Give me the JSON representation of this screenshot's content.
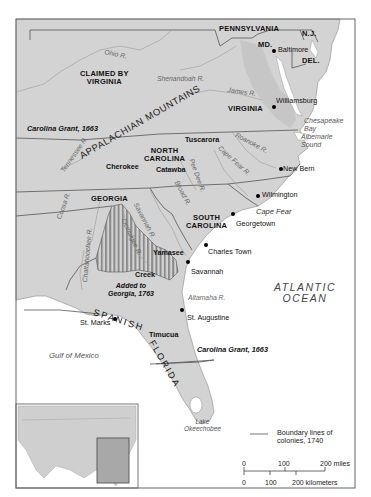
{
  "map": {
    "colors": {
      "land": "#d3d3d3",
      "land_dark": "#bdbdbd",
      "water": "#ffffff",
      "border": "#555555",
      "stripes": "#8a8a8a",
      "frame": "#666666"
    },
    "states": {
      "pennsylvania": "PENNSYLVANIA",
      "md": "MD.",
      "nj": "N.J.",
      "del": "DEL.",
      "claimed_by_virginia": "CLAIMED BY\nVIRGINIA",
      "virginia": "VIRGINIA",
      "north_carolina": "NORTH\nCAROLINA",
      "south_carolina": "SOUTH\nCAROLINA",
      "georgia": "GEORGIA",
      "spanish": "SPANISH",
      "florida": "FLORIDA"
    },
    "mountains": "APPALACHIAN MOUNTAINS",
    "tribes": [
      "Tuscarora",
      "Cherokee",
      "Catawba",
      "Yamasee",
      "Creek",
      "Timucua"
    ],
    "cities": {
      "baltimore": "Baltimore",
      "williamsburg": "Williamsburg",
      "new_bern": "New Bern",
      "wilmington": "Wilmington",
      "georgetown": "Georgetown",
      "charles_town": "Charles Town",
      "savannah": "Savannah",
      "st_augustine": "St. Augustine",
      "st_marks": "St. Marks"
    },
    "rivers": {
      "ohio": "Ohio R.",
      "shenandoah": "Shenandoah R.",
      "james": "James R.",
      "roanoke": "Roanoke R.",
      "cape_fear_r": "Cape Fear R.",
      "pee_dee": "Pee Dee R.",
      "broad": "Broad R.",
      "savannah_r": "Savannah R.",
      "tennessee": "Tennessee R.",
      "coosa": "Coosa R.",
      "chattahoochee": "Chattahoochee R.",
      "ocmulgee": "Ocmulgee R.",
      "altamaha": "Altamaha R."
    },
    "water_bodies": {
      "chesapeake": "Chesapeake\nBay",
      "albemarle": "Albemarle\nSound",
      "cape_fear": "Cape Fear",
      "atlantic": "ATLANTIC\nOCEAN",
      "gulf": "Gulf of Mexico",
      "okeechobee": "Lake\nOkeechobee"
    },
    "annotations": {
      "carolina_grant_north": "Carolina Grant, 1663",
      "carolina_grant_south": "Carolina Grant, 1663",
      "added_to_georgia": "Added to\nGeorgia, 1763"
    },
    "legend": {
      "boundary_label": "Boundary lines of\ncolonies, 1740"
    },
    "scale": {
      "miles_ticks": [
        "0",
        "100",
        "200 miles"
      ],
      "km_ticks": [
        "0",
        "100",
        "200 kilometers"
      ]
    }
  }
}
